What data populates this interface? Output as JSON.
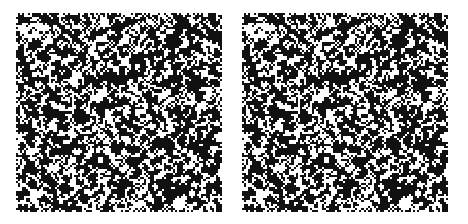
{
  "figure": {
    "type": "random-dot stereogram",
    "background": "#ffffff",
    "dot_color": "#111111",
    "panels": [
      {
        "id": "left",
        "label": ""
      },
      {
        "id": "right",
        "label": ""
      }
    ],
    "grid": {
      "cols": 100,
      "rows": 97,
      "density": 0.52
    },
    "disparity": {
      "shift_cells": 2,
      "region": {
        "x0": 30,
        "y0": 28,
        "x1": 70,
        "y1": 68
      }
    }
  }
}
